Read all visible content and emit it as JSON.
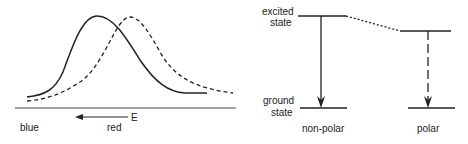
{
  "left_panel": {
    "axis_arrow_label": "E",
    "axis_left_label": "blue",
    "axis_right_label": "red",
    "curves": [
      {
        "name": "solid-spectrum",
        "style": "solid"
      },
      {
        "name": "dashed-spectrum",
        "style": "dashed"
      }
    ]
  },
  "right_panel": {
    "excited_label_line1": "excited",
    "excited_label_line2": "state",
    "ground_label_line1": "ground",
    "ground_label_line2": "state",
    "nonpolar_label": "non-polar",
    "polar_label": "polar"
  }
}
